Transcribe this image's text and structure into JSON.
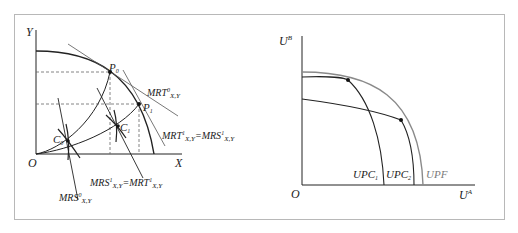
{
  "left_diagram": {
    "axes": {
      "y_label": "Y",
      "x_label": "X",
      "origin_label": "O"
    },
    "points": [
      {
        "label": "P",
        "sub": "0"
      },
      {
        "label": "P",
        "sub": "1"
      },
      {
        "label": "C",
        "sub": "0"
      },
      {
        "label": "C",
        "sub": "1"
      }
    ],
    "annotations": {
      "mrt0": {
        "main": "MRT",
        "sup": "0",
        "sub": "X,Y"
      },
      "mrt1_eq": {
        "a_main": "MRT",
        "a_sup": "1",
        "a_sub": "X,Y",
        "eq": "=",
        "b_main": "MRS",
        "b_sup": "1",
        "b_sub": "X,Y"
      },
      "mrs1_eq": {
        "a_main": "MRS",
        "a_sup": "1",
        "a_sub": "X,Y",
        "eq": "=",
        "b_main": "MRT",
        "b_sup": "1",
        "b_sub": "X,Y"
      },
      "mrs0": {
        "main": "MRS",
        "sup": "0",
        "sub": "X,Y"
      }
    }
  },
  "right_diagram": {
    "axes": {
      "y_label": "U",
      "y_sup": "B",
      "x_label": "U",
      "x_sup": "A",
      "origin_label": "O"
    },
    "curves": [
      {
        "label": "UPC",
        "sub": "1",
        "color": "#222222"
      },
      {
        "label": "UPC",
        "sub": "2",
        "color": "#222222"
      },
      {
        "label": "UPF",
        "sub": "",
        "color": "#7a7a7a"
      }
    ]
  },
  "colors": {
    "line": "#222222",
    "frontier_gray": "#8a8a8a",
    "border": "#b8b8b8"
  }
}
